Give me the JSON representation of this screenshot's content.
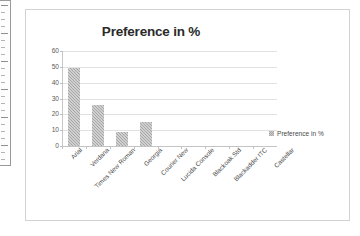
{
  "chart_data": {
    "type": "bar",
    "title": "Preference in %",
    "xlabel": "",
    "ylabel": "",
    "categories": [
      "Arial",
      "Verdana",
      "Times New Roman",
      "Georgia",
      "Courier New",
      "Lucida Console",
      "Blackoak Std",
      "Blackadder ITC",
      "Castellar"
    ],
    "values": [
      49,
      26,
      9,
      15,
      0,
      0,
      0,
      0,
      0
    ],
    "series": [
      {
        "name": "Preference in %",
        "values": [
          49,
          26,
          9,
          15,
          0,
          0,
          0,
          0,
          0
        ]
      }
    ],
    "ylim": [
      0,
      60
    ],
    "ytick_labels": [
      "60",
      "50",
      "40",
      "30",
      "20",
      "10",
      "0"
    ],
    "ytick_values": [
      60,
      50,
      40,
      30,
      20,
      10,
      0
    ],
    "ystep": 10,
    "grid": "horizontal",
    "legend": {
      "position": "right",
      "entries": [
        "Preference in %"
      ]
    },
    "bar_color": "#a8a8a8",
    "xlabel_rotation": -45
  },
  "legend": {
    "label": "Preference in %"
  }
}
